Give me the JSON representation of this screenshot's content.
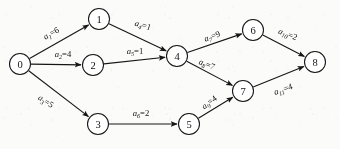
{
  "diagram": {
    "type": "directed-graph",
    "background_color": "#fbfbfa",
    "ink_color": "#161616",
    "nodes": [
      {
        "id": "0",
        "label": "0",
        "x": 20,
        "y": 64,
        "r": 10.5
      },
      {
        "id": "1",
        "label": "1",
        "x": 99,
        "y": 19,
        "r": 10.5
      },
      {
        "id": "2",
        "label": "2",
        "x": 93,
        "y": 65,
        "r": 10.5
      },
      {
        "id": "3",
        "label": "3",
        "x": 98,
        "y": 124,
        "r": 10.5
      },
      {
        "id": "4",
        "label": "4",
        "x": 177,
        "y": 56,
        "r": 10.5
      },
      {
        "id": "5",
        "label": "5",
        "x": 189,
        "y": 124,
        "r": 10.5
      },
      {
        "id": "6",
        "label": "6",
        "x": 253,
        "y": 30,
        "r": 10.5
      },
      {
        "id": "7",
        "label": "7",
        "x": 243,
        "y": 91,
        "r": 10.5
      },
      {
        "id": "8",
        "label": "8",
        "x": 315,
        "y": 62,
        "r": 10.5
      }
    ],
    "edges": [
      {
        "id": "a1",
        "from": "0",
        "to": "1",
        "var": "a",
        "sub": "1",
        "weight": "6",
        "label": "a₁=6",
        "label_x": 51,
        "label_y": 33,
        "label_rotate": -29
      },
      {
        "id": "a2",
        "from": "0",
        "to": "2",
        "var": "a",
        "sub": "2",
        "weight": "4",
        "label": "a₂=4",
        "label_x": 63,
        "label_y": 54,
        "label_rotate": 0
      },
      {
        "id": "a3",
        "from": "0",
        "to": "3",
        "var": "a",
        "sub": "3",
        "weight": "5",
        "label": "a₃=5",
        "label_x": 46,
        "label_y": 101,
        "label_rotate": 33
      },
      {
        "id": "a4",
        "from": "1",
        "to": "4",
        "var": "a",
        "sub": "4",
        "weight": "1",
        "label": "a₄=1",
        "label_x": 143,
        "label_y": 25,
        "label_rotate": 17
      },
      {
        "id": "a5",
        "from": "2",
        "to": "4",
        "var": "a",
        "sub": "5",
        "weight": "1",
        "label": "a₅=1",
        "label_x": 135,
        "label_y": 51,
        "label_rotate": 0
      },
      {
        "id": "a6",
        "from": "3",
        "to": "5",
        "var": "a",
        "sub": "6",
        "weight": "2",
        "label": "a₆=2",
        "label_x": 141,
        "label_y": 113,
        "label_rotate": 0
      },
      {
        "id": "a7",
        "from": "4",
        "to": "6",
        "var": "a",
        "sub": "7",
        "weight": "9",
        "label": "a₇=9",
        "label_x": 212,
        "label_y": 36,
        "label_rotate": -20
      },
      {
        "id": "a8",
        "from": "4",
        "to": "7",
        "var": "a",
        "sub": "8",
        "weight": "7",
        "label": "a₈=7",
        "label_x": 207,
        "label_y": 64,
        "label_rotate": 22
      },
      {
        "id": "a9",
        "from": "5",
        "to": "7",
        "var": "a",
        "sub": "9",
        "weight": "4",
        "label": "a₉=4",
        "label_x": 209,
        "label_y": 102,
        "label_rotate": -37
      },
      {
        "id": "a10",
        "from": "6",
        "to": "8",
        "var": "a",
        "sub": "10",
        "weight": "2",
        "label": "a₁₀=2",
        "label_x": 288,
        "label_y": 34,
        "label_rotate": 21
      },
      {
        "id": "a11",
        "from": "7",
        "to": "8",
        "var": "a",
        "sub": "11",
        "weight": "4",
        "label": "a₁₁=4",
        "label_x": 283,
        "label_y": 89,
        "label_rotate": -19
      }
    ]
  }
}
